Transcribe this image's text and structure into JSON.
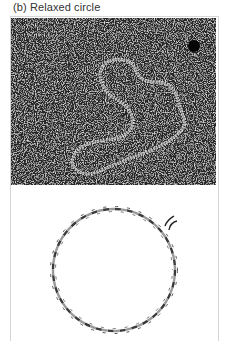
{
  "figure": {
    "label": "(b) Relaxed circle",
    "panels": [
      {
        "kind": "electron-micrograph",
        "subject": "relaxed circular DNA molecule"
      },
      {
        "kind": "schematic",
        "subject": "relaxed circular double helix with nick"
      }
    ],
    "colors": {
      "micrograph_background": "#2b2b2b",
      "dna_strand_dark": "#3a3a3a",
      "dna_strand_light": "#9a9a9a",
      "frame_border": "#d6d6d6"
    }
  }
}
